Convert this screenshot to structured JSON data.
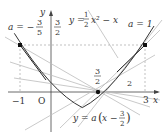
{
  "diagram": {
    "type": "function-graph",
    "axes": {
      "x_label": "x",
      "y_label": "y",
      "origin_label": "O",
      "tick_labels": {
        "neg_one": "−1",
        "three": "3"
      }
    },
    "curve": {
      "equation_lhs": "y =",
      "equation_frac_num": "1",
      "equation_frac_den": "2",
      "equation_rest": "x² − x",
      "vertex": [
        1,
        -0.5
      ]
    },
    "line_family": {
      "equation_lhs": "y = a",
      "equation_paren_open": "(",
      "equation_x": "x −",
      "equation_frac_num": "3",
      "equation_frac_den": "2",
      "equation_paren_close": ")",
      "pivot": [
        1.5,
        0
      ]
    },
    "labels": {
      "a_left_lhs": "a = −",
      "a_left_num": "3",
      "a_left_den": "5",
      "y_level_num": "3",
      "y_level_den": "2",
      "a_right": "a = 1",
      "pivot_num": "3",
      "pivot_den": "2",
      "mark_two": "2"
    },
    "points": [
      {
        "name": "left-intersection",
        "x": -1,
        "y": 1.5
      },
      {
        "name": "right-intersection",
        "x": 3,
        "y": 1.5
      },
      {
        "name": "pivot",
        "x": 1.5,
        "y": 0
      }
    ],
    "colors": {
      "curve": "#333333",
      "axes": "#444444",
      "lines": "#b8b8b8",
      "emphasis": "#222222",
      "dashed": "#999999"
    }
  }
}
